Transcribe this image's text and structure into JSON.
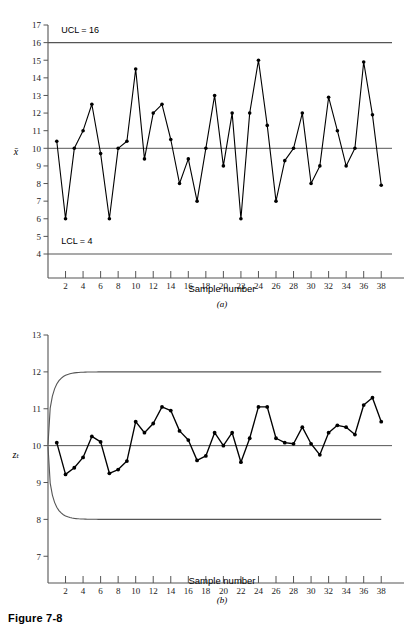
{
  "figure": {
    "caption": "Figure 7-8",
    "panel_a_label": "(a)",
    "panel_b_label": "(b)"
  },
  "chart_data": [
    {
      "id": "panel-a",
      "type": "line",
      "title": "",
      "xlabel": "Sample number",
      "ylabel": "x̄",
      "xlim": [
        0,
        39
      ],
      "ylim": [
        4,
        17
      ],
      "xticks": [
        2,
        4,
        6,
        8,
        10,
        12,
        14,
        16,
        18,
        20,
        22,
        24,
        26,
        28,
        30,
        32,
        34,
        36,
        38
      ],
      "yticks": [
        4,
        5,
        6,
        7,
        8,
        9,
        10,
        11,
        12,
        13,
        14,
        15,
        16,
        17
      ],
      "grid": false,
      "legend": "none",
      "annotations": [
        {
          "name": "ucl-label",
          "text": "UCL = 16",
          "x": 1.5,
          "y": 16.55
        },
        {
          "name": "lcl-label",
          "text": "LCL = 4",
          "x": 1.5,
          "y": 4.55
        }
      ],
      "reference_lines": [
        {
          "name": "upper-control-limit",
          "label": "UCL",
          "value": 16
        },
        {
          "name": "center-line",
          "label": "CL",
          "value": 10
        },
        {
          "name": "lower-control-limit",
          "label": "LCL",
          "value": 4
        }
      ],
      "x": [
        1,
        2,
        3,
        4,
        5,
        6,
        7,
        8,
        9,
        10,
        11,
        12,
        13,
        14,
        15,
        16,
        17,
        18,
        19,
        20,
        21,
        22,
        23,
        24,
        25,
        26,
        27,
        28,
        29,
        30,
        31,
        32,
        33,
        34,
        35,
        36,
        37,
        38
      ],
      "values": [
        10.4,
        6.0,
        10.0,
        11.0,
        12.5,
        9.7,
        6.0,
        10.0,
        10.4,
        14.5,
        9.4,
        12.0,
        12.5,
        10.5,
        8.0,
        9.4,
        7.0,
        10.0,
        13.0,
        9.0,
        12.0,
        6.0,
        12.0,
        15.0,
        11.3,
        7.0,
        9.3,
        10.0,
        12.0,
        8.0,
        9.0,
        12.9,
        11.0,
        9.0,
        10.0,
        14.9,
        11.9,
        7.9
      ]
    },
    {
      "id": "panel-b",
      "type": "line",
      "title": "",
      "xlabel": "Sample number",
      "ylabel": "zₜ",
      "xlim": [
        0,
        39
      ],
      "ylim": [
        6.6,
        13
      ],
      "xticks": [
        2,
        4,
        6,
        8,
        10,
        12,
        14,
        16,
        18,
        20,
        22,
        24,
        26,
        28,
        30,
        32,
        34,
        36,
        38
      ],
      "yticks": [
        7,
        8,
        9,
        10,
        11,
        12,
        13
      ],
      "grid": false,
      "legend": "none",
      "annotations": [],
      "reference_lines": [
        {
          "name": "center-line",
          "label": "CL",
          "value": 10
        },
        {
          "name": "upper-control-limit-asymptote",
          "label": "UCL",
          "value": 12
        },
        {
          "name": "lower-control-limit-asymptote",
          "label": "LCL",
          "value": 8
        }
      ],
      "limit_curve_note": "widening exponential control limits converging to 12 and 8",
      "x": [
        1,
        2,
        3,
        4,
        5,
        6,
        7,
        8,
        9,
        10,
        11,
        12,
        13,
        14,
        15,
        16,
        17,
        18,
        19,
        20,
        21,
        22,
        23,
        24,
        25,
        26,
        27,
        28,
        29,
        30,
        31,
        32,
        33,
        34,
        35,
        36,
        37,
        38
      ],
      "values": [
        10.08,
        9.22,
        9.4,
        9.68,
        10.25,
        10.1,
        9.25,
        9.35,
        9.58,
        10.65,
        10.35,
        10.6,
        11.05,
        10.95,
        10.4,
        10.15,
        9.6,
        9.72,
        10.35,
        10.0,
        10.35,
        9.55,
        10.2,
        11.05,
        11.05,
        10.2,
        10.08,
        10.05,
        10.5,
        10.05,
        9.75,
        10.35,
        10.55,
        10.5,
        10.3,
        11.1,
        11.3,
        10.65
      ]
    }
  ]
}
